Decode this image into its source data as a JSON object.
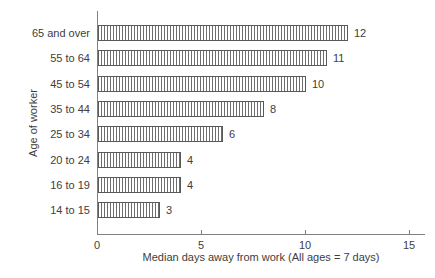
{
  "chart_data": {
    "type": "bar",
    "orientation": "horizontal",
    "title": "",
    "xlabel": "Median days away from work (All ages = 7 days)",
    "ylabel": "Age of worker",
    "categories": [
      "65 and over",
      "55 to 64",
      "45 to 54",
      "35 to 44",
      "25 to 34",
      "20 to 24",
      "16 to 19",
      "14 to 15"
    ],
    "values": [
      12,
      11,
      10,
      8,
      6,
      4,
      4,
      3
    ],
    "value_labels": [
      "12",
      "11",
      "10",
      "8",
      "6",
      "4",
      "4",
      "3"
    ],
    "xticks": [
      0,
      5,
      10,
      15
    ],
    "xtick_labels": [
      "0",
      "5",
      "10",
      "15"
    ],
    "xlim": [
      0,
      15.75
    ],
    "grid": false,
    "legend": "none",
    "bar_style": "vertical-hatch",
    "colors": {
      "background": "#ffffff",
      "bar_border": "#595959",
      "bar_hatch": "#6e6e6e",
      "axis": "#808080",
      "text": "#404040"
    }
  }
}
